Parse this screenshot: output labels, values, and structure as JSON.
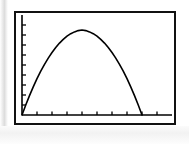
{
  "screen": {
    "title": "Graphing calculator plot window",
    "width": 189,
    "height": 144,
    "background_color": "#ffffff",
    "frame_color": "#111111",
    "curve_color": "#000000",
    "axis_color": "#000000"
  },
  "chart_data": {
    "type": "line",
    "title": "",
    "subtitle": "",
    "xlabel": "",
    "ylabel": "",
    "grid": false,
    "legend": null,
    "annotations": [],
    "axes": {
      "x_axis_position": "bottom",
      "y_axis_position": "left",
      "xlim": [
        0,
        10
      ],
      "ylim": [
        0,
        10
      ],
      "x_tick_count": 9,
      "y_tick_count": 9,
      "x_tick_labels": [],
      "y_tick_labels": [],
      "x_ticks": [
        1,
        2,
        3,
        4,
        5,
        6,
        7,
        8,
        9
      ],
      "y_ticks": [
        1,
        2,
        3,
        4,
        5,
        6,
        7,
        8,
        9
      ],
      "tick_direction": "inward"
    },
    "series": [
      {
        "name": "parabola",
        "shape": "downward-opening parabola",
        "color": "#000000",
        "line_width": 1.6,
        "x": [
          0.0,
          0.25,
          0.5,
          0.75,
          1.0,
          1.25,
          1.5,
          1.75,
          2.0,
          2.25,
          2.5,
          2.75,
          3.0,
          3.25,
          3.5,
          3.75,
          4.0,
          4.25,
          4.5,
          4.75,
          5.0,
          5.25,
          5.5,
          5.75,
          6.0,
          6.25,
          6.5,
          6.75,
          7.0,
          7.25,
          7.5,
          7.75,
          8.0
        ],
        "values": [
          0.0,
          1.0,
          1.94,
          2.81,
          3.63,
          4.38,
          5.06,
          5.69,
          6.25,
          6.75,
          7.19,
          7.56,
          7.88,
          8.13,
          8.31,
          8.44,
          8.5,
          8.44,
          8.31,
          8.13,
          7.88,
          7.56,
          7.19,
          6.75,
          6.25,
          5.69,
          5.06,
          4.38,
          3.63,
          2.81,
          1.94,
          1.0,
          0.0
        ]
      }
    ]
  }
}
